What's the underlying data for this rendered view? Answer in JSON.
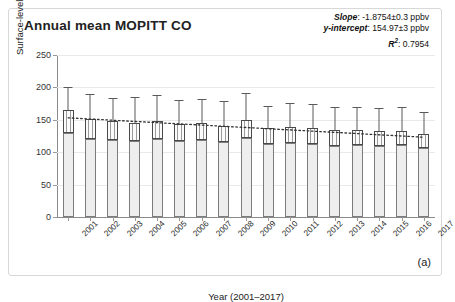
{
  "figure": {
    "title": "Annual mean MOPITT CO",
    "panel_label": "(a)",
    "border_color": "#d8d8d8",
    "background": "#ffffff"
  },
  "stats": {
    "slope_key": "Slope",
    "slope_value": ": -1.8754±0.3 ppbv",
    "intercept_key": "y-intercept",
    "intercept_value": ": 154.97±3 ppbv",
    "r2_key": "R",
    "r2_sup": "2",
    "r2_value": ": 0.7954"
  },
  "chart_data": {
    "type": "bar",
    "title": "Annual mean MOPITT CO",
    "xlabel": "Year (2001–2017)",
    "ylabel": "Surface-level CO (ppbv)",
    "ylim": [
      0,
      250
    ],
    "yticks": [
      0,
      50,
      100,
      150,
      200,
      250
    ],
    "ytick_labels": [
      "0",
      "50",
      "100",
      "150",
      "200",
      "250"
    ],
    "grid": true,
    "legend": "none",
    "bar_color": "#eeeeee",
    "bar_edge_color": "#7c7c7c",
    "errorbar_color": "#5a5a5a",
    "trend_color": "#333333",
    "trend_style": "dotted",
    "categories": [
      "2001",
      "2002",
      "2003",
      "2004",
      "2005",
      "2006",
      "2007",
      "2008",
      "2009",
      "2010",
      "2011",
      "2012",
      "2013",
      "2014",
      "2015",
      "2016",
      "2017"
    ],
    "values": [
      165,
      152,
      148,
      145,
      148,
      144,
      145,
      141,
      150,
      137,
      139,
      137,
      134,
      134,
      133,
      133,
      128
    ],
    "box_lower": [
      130,
      120,
      119,
      118,
      120,
      118,
      119,
      115,
      122,
      112,
      114,
      113,
      110,
      111,
      110,
      111,
      106
    ],
    "error_high": [
      200,
      190,
      184,
      185,
      188,
      181,
      182,
      179,
      192,
      172,
      176,
      174,
      169,
      170,
      168,
      170,
      162
    ],
    "trend_start": 153.1,
    "trend_end": 123.1,
    "fit": {
      "slope": -1.8754,
      "slope_error": 0.3,
      "intercept": 154.97,
      "intercept_error": 3,
      "r_squared": 0.7954,
      "units": "ppbv"
    }
  }
}
